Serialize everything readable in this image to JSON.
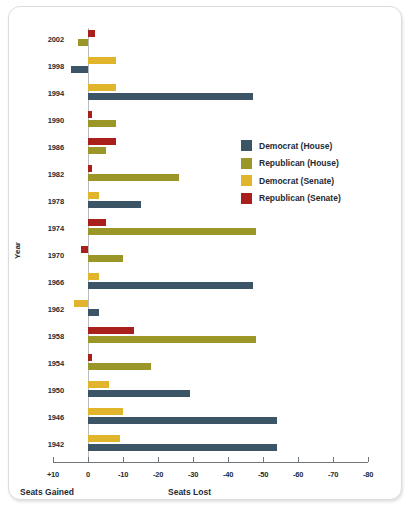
{
  "chart_data": {
    "type": "bar",
    "orientation": "horizontal",
    "title": "",
    "xlabel": "Seats Lost",
    "xlabel_left": "Seats Gained",
    "ylabel": "Year",
    "xlim": [
      10,
      -80
    ],
    "xticks": [
      "+10",
      "0",
      "-10",
      "-20",
      "-30",
      "-40",
      "-50",
      "-60",
      "-70",
      "-80"
    ],
    "xtick_values": [
      10,
      0,
      -10,
      -20,
      -30,
      -40,
      -50,
      -60,
      -70,
      -80
    ],
    "grid": false,
    "legend_position": "right",
    "categories": [
      2002,
      1998,
      1994,
      1990,
      1986,
      1982,
      1978,
      1974,
      1970,
      1966,
      1962,
      1958,
      1954,
      1950,
      1946,
      1942
    ],
    "series": [
      {
        "name": "Democrat (House)",
        "color": "#3c5566",
        "values": [
          null,
          5,
          -47,
          null,
          null,
          null,
          -15,
          null,
          null,
          -47,
          -3,
          null,
          null,
          -29,
          -54,
          -54
        ]
      },
      {
        "name": "Republican (House)",
        "color": "#9a9628",
        "values": [
          3,
          null,
          null,
          -8,
          -5,
          -26,
          null,
          -48,
          -10,
          null,
          null,
          -48,
          -18,
          null,
          null,
          null
        ]
      },
      {
        "name": "Democrat (Senate)",
        "color": "#e0b52c",
        "values": [
          null,
          -8,
          -8,
          null,
          null,
          null,
          -3,
          null,
          null,
          -3,
          4,
          null,
          null,
          -6,
          -10,
          -9
        ]
      },
      {
        "name": "Republican (Senate)",
        "color": "#a81f1b",
        "values": [
          -2,
          null,
          null,
          -1,
          -8,
          -1,
          null,
          -5,
          2,
          null,
          null,
          -13,
          -1,
          null,
          null,
          null
        ]
      }
    ]
  },
  "axis": {
    "y_title": "Year",
    "caption_left": "Seats Gained",
    "caption_right": "Seats Lost"
  },
  "legend": {
    "items": [
      {
        "label": "Democrat (House)",
        "color": "#3c5566"
      },
      {
        "label": "Republican (House)",
        "color": "#9a9628"
      },
      {
        "label": "Democrat (Senate)",
        "color": "#e0b52c"
      },
      {
        "label": "Republican (Senate)",
        "color": "#a81f1b"
      }
    ]
  }
}
